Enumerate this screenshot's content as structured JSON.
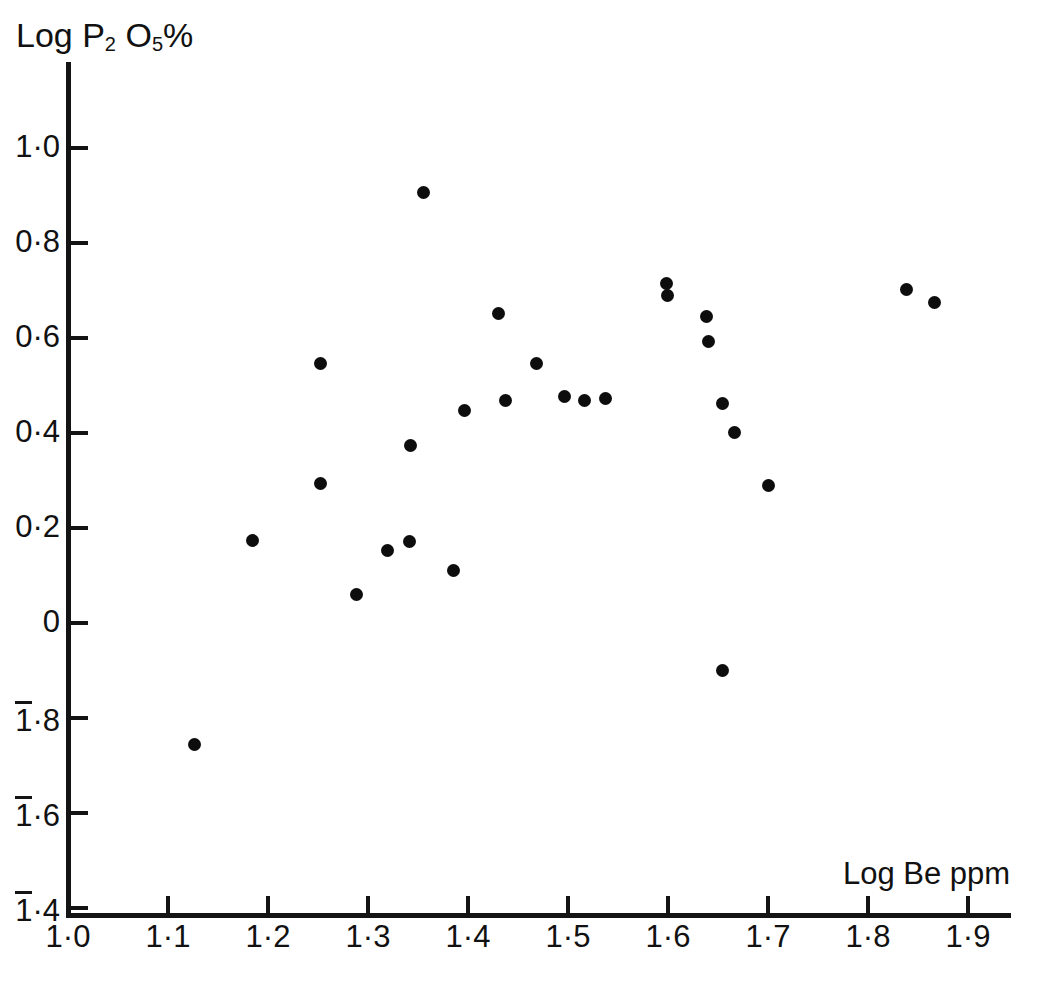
{
  "figure": {
    "background": "#ffffff",
    "ink_color": "#141414",
    "point_color": "#0d0d0d"
  },
  "axes": {
    "y_title": "Log P",
    "y_title_sub1": "2",
    "y_title_mid": " O",
    "y_title_sub2": "5",
    "y_title_end": "%",
    "x_title": "Log  Be ppm",
    "y_ticks": [
      {
        "label": "1·0",
        "value": 1.0,
        "overbar": false
      },
      {
        "label": "0·8",
        "value": 0.8,
        "overbar": false
      },
      {
        "label": "0·6",
        "value": 0.6,
        "overbar": false
      },
      {
        "label": "0·4",
        "value": 0.4,
        "overbar": false
      },
      {
        "label": "0·2",
        "value": 0.2,
        "overbar": false
      },
      {
        "label": "0",
        "value": 0.0,
        "overbar": false
      },
      {
        "label": "1·8",
        "value": -0.2,
        "overbar": true
      },
      {
        "label": "1·6",
        "value": -0.4,
        "overbar": true
      },
      {
        "label": "1·4",
        "value": -0.6,
        "overbar": true
      }
    ],
    "x_ticks": [
      {
        "label": "1·0",
        "value": 1.0
      },
      {
        "label": "1·1",
        "value": 1.1
      },
      {
        "label": "1·2",
        "value": 1.2
      },
      {
        "label": "1·3",
        "value": 1.3
      },
      {
        "label": "1·4",
        "value": 1.4
      },
      {
        "label": "1·5",
        "value": 1.5
      },
      {
        "label": "1·6",
        "value": 1.6
      },
      {
        "label": "1·7",
        "value": 1.7
      },
      {
        "label": "1·8",
        "value": 1.8
      },
      {
        "label": "1·9",
        "value": 1.9
      }
    ]
  },
  "chart_data": {
    "type": "scatter",
    "title": "",
    "xlabel": "Log  Be ppm",
    "ylabel": "Log P2O5%",
    "xlim": [
      1.0,
      1.945
    ],
    "ylim": [
      -0.615,
      1.18
    ],
    "grid": false,
    "legend": "none",
    "marker": "filled-circle",
    "note_y_axis_notation": "Values below zero are written with an overbar on the characteristic: 1·8 = -0.2, 1·6 = -0.4, 1·4 = -0.6",
    "points": [
      {
        "x": 1.126,
        "y": -0.255
      },
      {
        "x": 1.184,
        "y": 0.173
      },
      {
        "x": 1.252,
        "y": 0.293
      },
      {
        "x": 1.252,
        "y": 0.547
      },
      {
        "x": 1.288,
        "y": 0.059
      },
      {
        "x": 1.355,
        "y": 0.907
      },
      {
        "x": 1.319,
        "y": 0.152
      },
      {
        "x": 1.341,
        "y": 0.172
      },
      {
        "x": 1.342,
        "y": 0.373
      },
      {
        "x": 1.396,
        "y": 0.448
      },
      {
        "x": 1.43,
        "y": 0.652
      },
      {
        "x": 1.437,
        "y": 0.469
      },
      {
        "x": 1.385,
        "y": 0.111
      },
      {
        "x": 1.468,
        "y": 0.547
      },
      {
        "x": 1.496,
        "y": 0.477
      },
      {
        "x": 1.516,
        "y": 0.469
      },
      {
        "x": 1.537,
        "y": 0.472
      },
      {
        "x": 1.598,
        "y": 0.715
      },
      {
        "x": 1.599,
        "y": 0.69
      },
      {
        "x": 1.638,
        "y": 0.646
      },
      {
        "x": 1.64,
        "y": 0.592
      },
      {
        "x": 1.654,
        "y": 0.462
      },
      {
        "x": 1.666,
        "y": 0.401
      },
      {
        "x": 1.7,
        "y": 0.289
      },
      {
        "x": 1.654,
        "y": -0.099
      },
      {
        "x": 1.838,
        "y": 0.703
      },
      {
        "x": 1.866,
        "y": 0.675
      }
    ]
  }
}
